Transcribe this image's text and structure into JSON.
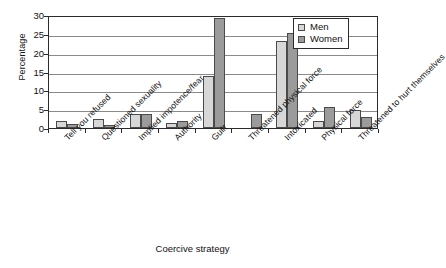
{
  "chart_data": {
    "type": "bar",
    "title": "",
    "xlabel": "Coercive strategy",
    "ylabel": "Percentage",
    "ylim": [
      0,
      30
    ],
    "yticks": [
      0,
      5,
      10,
      15,
      20,
      25,
      30
    ],
    "grid": true,
    "legend_position": "top-right",
    "categories": [
      "Tell you refused",
      "Questioned sexuality",
      "Implied impotence/fear",
      "Authority",
      "Guilt",
      "Threatened physical force",
      "Intoxicated",
      "Physical force",
      "Threatened to hurt themselves"
    ],
    "series": [
      {
        "name": "Men",
        "color": "#d7d7d7",
        "values": [
          1.9,
          2.5,
          3.8,
          1.4,
          13.8,
          0.0,
          23.0,
          1.9,
          4.8
        ]
      },
      {
        "name": "Women",
        "color": "#9b9b9b",
        "values": [
          1.0,
          0.8,
          3.6,
          1.9,
          29.3,
          3.6,
          25.3,
          5.6,
          3.0
        ]
      }
    ]
  },
  "legend": {
    "items": [
      {
        "label": "Men"
      },
      {
        "label": "Women"
      }
    ]
  },
  "axes": {
    "y_title": "Percentage",
    "x_title": "Coercive strategy",
    "y_tick_labels": [
      "30",
      "25",
      "20",
      "15",
      "10",
      "5",
      "0"
    ]
  }
}
